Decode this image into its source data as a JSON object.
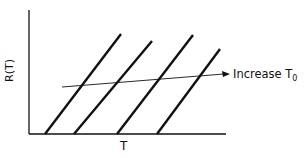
{
  "diagram": {
    "y_label": "R(T)",
    "x_label": "T",
    "arrow_label": "Increase T",
    "arrow_label_sub": "0",
    "lines": [
      {
        "x1": 45,
        "y1": 134,
        "x2": 121,
        "y2": 34
      },
      {
        "x1": 74,
        "y1": 134,
        "x2": 152,
        "y2": 41
      },
      {
        "x1": 117,
        "y1": 134,
        "x2": 193,
        "y2": 35
      },
      {
        "x1": 157,
        "y1": 134,
        "x2": 220,
        "y2": 49
      }
    ],
    "stroke_color": "#111111"
  }
}
